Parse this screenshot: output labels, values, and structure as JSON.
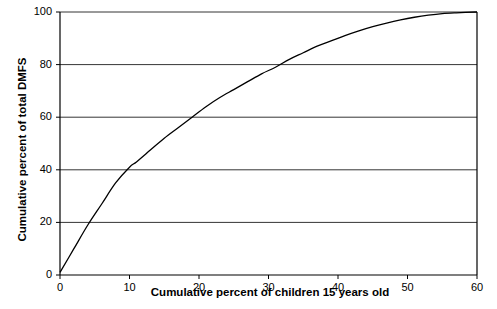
{
  "chart_data": {
    "type": "line",
    "title": "",
    "xlabel": "Cumulative percent of children 15 years old",
    "ylabel": "Cumulative percent of total DMFS",
    "xlim": [
      0,
      60
    ],
    "ylim": [
      0,
      100
    ],
    "xticks": [
      0,
      10,
      20,
      30,
      40,
      50,
      60
    ],
    "xtick_labels": [
      "0",
      "10",
      "20",
      "30",
      "40",
      "50",
      "60"
    ],
    "yticks": [
      0,
      20,
      40,
      60,
      80,
      100
    ],
    "ytick_labels": [
      "0",
      "20",
      "40",
      "60",
      "80",
      "100"
    ],
    "grid": "horizontal",
    "legend": "none",
    "series": [
      {
        "name": "Cumulative DMFS distribution",
        "color": "#000000",
        "x": [
          0,
          2,
          4,
          6,
          8,
          10,
          11,
          13,
          15,
          17,
          19,
          21,
          23,
          25,
          27,
          29,
          31,
          33,
          35,
          37,
          39,
          41,
          43,
          45,
          47,
          49,
          51,
          53,
          55,
          57,
          60
        ],
        "y": [
          1,
          10,
          19,
          27,
          35,
          41,
          43,
          47.5,
          52,
          56,
          60,
          64,
          67.5,
          70.5,
          73.5,
          76.5,
          79,
          82,
          84.5,
          87,
          89,
          91,
          92.8,
          94.4,
          95.8,
          97,
          98,
          98.8,
          99.4,
          99.7,
          100
        ]
      }
    ]
  },
  "axes": {
    "y_title": "Cumulative percent of total DMFS",
    "x_title": "Cumulative percent of children 15 years old"
  }
}
